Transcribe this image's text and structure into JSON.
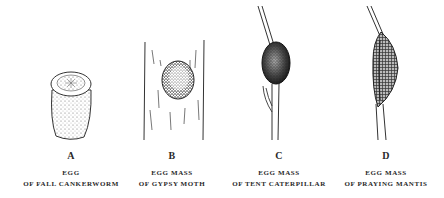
{
  "figure": {
    "panels": [
      {
        "letter": "A",
        "line1": "EGG",
        "line2": "OF FALL CANKERWORM",
        "subject": "fall-cankerworm-egg"
      },
      {
        "letter": "B",
        "line1": "EGG MASS",
        "line2": "OF GYPSY MOTH",
        "subject": "gypsy-moth-egg-mass"
      },
      {
        "letter": "C",
        "line1": "EGG MASS",
        "line2": "OF TENT CATERPILLAR",
        "subject": "tent-caterpillar-egg-mass"
      },
      {
        "letter": "D",
        "line1": "EGG MASS",
        "line2": "OF PRAYING MANTIS",
        "subject": "praying-mantis-egg-mass"
      }
    ],
    "colors": {
      "ink": "#2a2a2a",
      "background": "#ffffff"
    }
  }
}
